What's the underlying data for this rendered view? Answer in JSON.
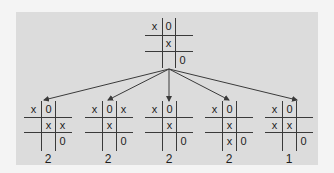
{
  "diagram": {
    "type": "game-tree",
    "title": "",
    "colors": {
      "background": "#f4f4f4",
      "panel": "#dcdcdc",
      "lines": "#3a3a3a",
      "text": "#1e1e1e"
    },
    "root": {
      "board": [
        [
          "x",
          "0",
          ""
        ],
        [
          "",
          "x",
          ""
        ],
        [
          "",
          "",
          "0"
        ]
      ]
    },
    "children": [
      {
        "board": [
          [
            "x",
            "0",
            ""
          ],
          [
            "",
            "x",
            "x"
          ],
          [
            "",
            "",
            "0"
          ]
        ],
        "score": "2"
      },
      {
        "board": [
          [
            "x",
            "0",
            "x"
          ],
          [
            "",
            "x",
            ""
          ],
          [
            "",
            "",
            "0"
          ]
        ],
        "score": "2"
      },
      {
        "board": [
          [
            "x",
            "0",
            ""
          ],
          [
            "",
            "x",
            ""
          ],
          [
            "",
            "",
            "0"
          ]
        ],
        "score": "2"
      },
      {
        "board": [
          [
            "x",
            "0",
            ""
          ],
          [
            "",
            "x",
            ""
          ],
          [
            "",
            "x",
            "0"
          ]
        ],
        "score": "2"
      },
      {
        "board": [
          [
            "x",
            "0",
            ""
          ],
          [
            "x",
            "x",
            ""
          ],
          [
            "",
            "",
            "0"
          ]
        ],
        "score": "1"
      }
    ]
  }
}
